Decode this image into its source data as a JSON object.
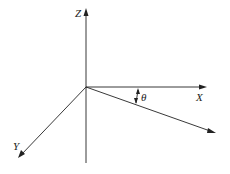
{
  "diagram": {
    "axes": {
      "z_label": "Z",
      "x_label": "X",
      "y_label": "Y"
    },
    "angle_label": "θ",
    "colors": {
      "line": "#222222",
      "background": "#ffffff"
    }
  }
}
